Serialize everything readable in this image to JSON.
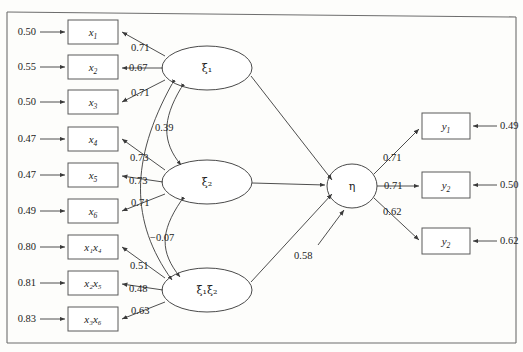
{
  "figure": {
    "type": "structural-equation-model-path-diagram"
  },
  "indicators": [
    {
      "name": "x1",
      "label": "x",
      "subscript": "1",
      "error": "0.50",
      "loading": "0.71",
      "factor": "xi1"
    },
    {
      "name": "x2",
      "label": "x",
      "subscript": "2",
      "error": "0.55",
      "loading": "0.67",
      "factor": "xi1"
    },
    {
      "name": "x3",
      "label": "x",
      "subscript": "3",
      "error": "0.50",
      "loading": "0.71",
      "factor": "xi1"
    },
    {
      "name": "x4",
      "label": "x",
      "subscript": "4",
      "error": "0.47",
      "loading": "0.73",
      "factor": "xi2"
    },
    {
      "name": "x5",
      "label": "x",
      "subscript": "5",
      "error": "0.47",
      "loading": "0.73",
      "factor": "xi2"
    },
    {
      "name": "x6",
      "label": "x",
      "subscript": "6",
      "error": "0.49",
      "loading": "0.71",
      "factor": "xi2"
    },
    {
      "name": "x1x4",
      "label": "x₁x₄",
      "subscript": "",
      "error": "0.80",
      "loading": "0.51",
      "factor": "xi1xi2"
    },
    {
      "name": "x2x5",
      "label": "x₂x₅",
      "subscript": "",
      "error": "0.81",
      "loading": "0.48",
      "factor": "xi1xi2"
    },
    {
      "name": "x3x6",
      "label": "x₃x₆",
      "subscript": "",
      "error": "0.83",
      "loading": "0.63",
      "factor": "xi1xi2"
    }
  ],
  "latent_factors": [
    {
      "name": "xi1",
      "label": "ξ₁"
    },
    {
      "name": "xi2",
      "label": "ξ₂"
    },
    {
      "name": "xi1xi2",
      "label": "ξ₁ξ₂"
    },
    {
      "name": "eta",
      "label": "η"
    }
  ],
  "covariances": [
    {
      "name": "cov-xi1-xi2",
      "between": [
        "xi1",
        "xi2"
      ],
      "value": "0.39"
    },
    {
      "name": "cov-xi2-xi1xi2",
      "between": [
        "xi2",
        "xi1xi2"
      ],
      "value": "−0.07"
    }
  ],
  "disturbance": {
    "name": "eta-disturbance",
    "value": "0.58"
  },
  "outcomes": [
    {
      "name": "y1",
      "label": "y",
      "subscript": "1",
      "loading": "0.71",
      "error": "0.49"
    },
    {
      "name": "y2",
      "label": "y",
      "subscript": "2",
      "loading": "0.71",
      "error": "0.50"
    },
    {
      "name": "y3",
      "label": "y",
      "subscript": "2",
      "loading": "0.62",
      "error": "0.62"
    }
  ]
}
